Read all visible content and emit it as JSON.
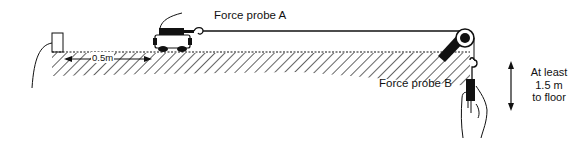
{
  "diagram": {
    "type": "physics apparatus — trolley on bench with pulley and hanging force probe",
    "labels": {
      "force_probe_a": "Force probe A",
      "force_probe_b": "Force probe B",
      "distance": "0.5m",
      "height_line1": "At least",
      "height_line2": "1.5 m",
      "height_line3": "to floor"
    },
    "components": [
      {
        "name": "end-stop-block",
        "description": "small rectangular stop at left end of bench with cable"
      },
      {
        "name": "trolley",
        "description": "dynamics trolley carrying force probe A, connected by string"
      },
      {
        "name": "bench",
        "description": "hatched bench surface"
      },
      {
        "name": "pulley",
        "description": "pulley clamped at right edge of bench"
      },
      {
        "name": "force-probe-b",
        "description": "hook-ended probe held in hand below pulley"
      },
      {
        "name": "hand",
        "description": "hand holding force probe B"
      },
      {
        "name": "height-arrow",
        "description": "double-headed vertical arrow indicating height to floor"
      }
    ],
    "colors": {
      "line": "#111111",
      "background": "#ffffff"
    }
  }
}
